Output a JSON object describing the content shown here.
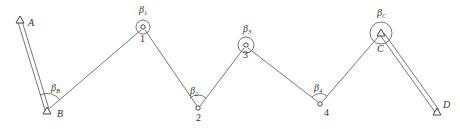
{
  "diagram": {
    "title": "",
    "known_points": [
      {
        "id": "A",
        "label": "A",
        "type": "triangle"
      },
      {
        "id": "B",
        "label": "B",
        "type": "triangle"
      },
      {
        "id": "C",
        "label": "C",
        "type": "triangle"
      },
      {
        "id": "D",
        "label": "D",
        "type": "triangle"
      }
    ],
    "traverse_points": [
      {
        "id": "1",
        "label": "1",
        "type": "circle"
      },
      {
        "id": "2",
        "label": "2",
        "type": "circle"
      },
      {
        "id": "3",
        "label": "3",
        "type": "circle"
      },
      {
        "id": "4",
        "label": "4",
        "type": "circle"
      }
    ],
    "angles": [
      {
        "vertex": "B",
        "symbol": "β",
        "subscript": "B"
      },
      {
        "vertex": "1",
        "symbol": "β",
        "subscript": "1"
      },
      {
        "vertex": "2",
        "symbol": "β",
        "subscript": "2"
      },
      {
        "vertex": "3",
        "symbol": "β",
        "subscript": "3"
      },
      {
        "vertex": "4",
        "symbol": "β",
        "subscript": "4"
      },
      {
        "vertex": "C",
        "symbol": "β",
        "subscript": "C"
      }
    ],
    "known_sides": [
      [
        "A",
        "B"
      ],
      [
        "C",
        "D"
      ]
    ],
    "traverse_sides": [
      [
        "B",
        "1"
      ],
      [
        "1",
        "2"
      ],
      [
        "2",
        "3"
      ],
      [
        "3",
        "4"
      ],
      [
        "4",
        "C"
      ]
    ]
  }
}
